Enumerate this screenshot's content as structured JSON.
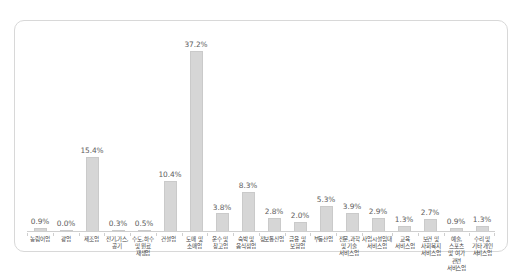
{
  "chart_data": {
    "type": "bar",
    "title": "",
    "subtitle": "",
    "xlabel": "",
    "ylabel": "",
    "ylim": [
      0,
      40
    ],
    "grid": false,
    "legend": false,
    "value_suffix": "%",
    "bar_color": "#d6d6d6",
    "bar_border_color": "#cacaca",
    "axis_color": "#cfcfcf",
    "label_color": "#3f3f3f",
    "value_label_color": "#5d5d5d",
    "categories": [
      "농림어업",
      "광업",
      "제조업",
      "전기,가스, 공기",
      "수도,하수 및 원료 재생업",
      "건설업",
      "도매 및 소매업",
      "운수 및 창고업",
      "숙박 및 음식점업",
      "정보통신업",
      "금융 및 보험업",
      "부동산업",
      "전문,과학 및 기술 서비스업",
      "사업시설임대 서비스업",
      "교육 서비스업",
      "보건 및 사회복지 서비스업",
      "예술,스포츠 및 여가 관련 서비스업",
      "수리 및 기타 개인 서비스업"
    ],
    "category_lines": [
      [
        "농림어업"
      ],
      [
        "광업"
      ],
      [
        "제조업"
      ],
      [
        "전기,가스,",
        "공기"
      ],
      [
        "수도,하수",
        "및 원료",
        "재생업"
      ],
      [
        "건설업"
      ],
      [
        "도매 및",
        "소매업"
      ],
      [
        "운수 및",
        "창고업"
      ],
      [
        "숙박 및",
        "음식점업"
      ],
      [
        "정보통신업"
      ],
      [
        "금융 및",
        "보험업"
      ],
      [
        "부동산업"
      ],
      [
        "전문,과학",
        "및 기술",
        "서비스업"
      ],
      [
        "사업시설임대",
        "서비스업"
      ],
      [
        "교육",
        "서비스업"
      ],
      [
        "보건 및",
        "사회복지",
        "서비스업"
      ],
      [
        "예술,스포츠",
        "및 여가 관련",
        "서비스업"
      ],
      [
        "수리 및",
        "기타 개인",
        "서비스업"
      ]
    ],
    "values": [
      0.9,
      0.0,
      15.4,
      0.3,
      0.5,
      10.4,
      37.2,
      3.8,
      8.3,
      2.8,
      2.0,
      5.3,
      3.9,
      2.9,
      1.3,
      2.7,
      0.9,
      1.3
    ],
    "value_labels": [
      "0.9%",
      "0.0%",
      "15.4%",
      "0.3%",
      "0.5%",
      "10.4%",
      "37.2%",
      "3.8%",
      "8.3%",
      "2.8%",
      "2.0%",
      "5.3%",
      "3.9%",
      "2.9%",
      "1.3%",
      "2.7%",
      "0.9%",
      "1.3%"
    ]
  }
}
